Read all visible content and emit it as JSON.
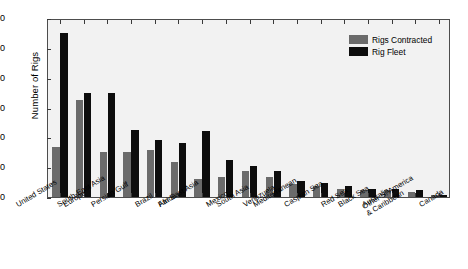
{
  "chart_data": {
    "type": "bar",
    "title": "",
    "xlabel": "",
    "ylabel": "Number of Rigs",
    "ylim": [
      0,
      300
    ],
    "yticks": [
      0,
      50,
      100,
      150,
      200,
      250,
      300
    ],
    "grid": false,
    "legend_position": "top-right",
    "categories": [
      "United States",
      "Europe",
      "South-East Asia",
      "Persian Gulf",
      "Brazil",
      "Africa",
      "Far East Asia",
      "Mexico",
      "South Asia",
      "Venezuela",
      "Mediterranean",
      "Caspian Sea",
      "Red Sea",
      "Black Sea",
      "Australia",
      "Other S. America\n& Caribbean",
      "Canada"
    ],
    "series": [
      {
        "name": "Rigs Contracted",
        "color": "#6b6b6b",
        "values": [
          83,
          162,
          75,
          75,
          79,
          59,
          31,
          33,
          44,
          33,
          22,
          18,
          14,
          11,
          11,
          8,
          3
        ]
      },
      {
        "name": "Rig Fleet",
        "color": "#0d0d0d",
        "values": [
          275,
          175,
          175,
          112,
          96,
          90,
          111,
          62,
          52,
          44,
          27,
          24,
          19,
          14,
          14,
          11,
          4
        ]
      }
    ]
  },
  "legend": {
    "items": [
      {
        "label": "Rigs Contracted"
      },
      {
        "label": "Rig Fleet"
      }
    ]
  },
  "axes": {
    "y_title": "Number of Rigs",
    "y_tick_labels": [
      "0",
      "50",
      "100",
      "150",
      "200",
      "250",
      "300"
    ]
  },
  "colors": {
    "contracted": "#6b6b6b",
    "fleet": "#0d0d0d",
    "plot_background": "#f2f2f2",
    "figure_background": "#ffffff",
    "axis": "#4d4d4d"
  }
}
